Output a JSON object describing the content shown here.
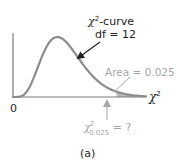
{
  "figure": {
    "caption": "(a)",
    "curve_label": {
      "symbol": "χ",
      "superscript": "2",
      "text": "-curve"
    },
    "df_label": "df = 12",
    "area_label": "Area = 0.025",
    "critical_value_label": {
      "symbol": "χ",
      "superscript": "2",
      "subscript": "0.025",
      "suffix": " = ?"
    },
    "x_axis_label": {
      "symbol": "χ",
      "superscript": "2"
    },
    "origin_label": "0",
    "colors": {
      "curve": "#8c8c8c",
      "axis": "#7a7a7a",
      "annotation_gray": "#a6a6a6",
      "text": "#222222",
      "arrow": "#222222",
      "shade": "#bdbdbd"
    }
  },
  "chart_data": {
    "type": "line",
    "distribution": "chi-square",
    "df": 12,
    "upper_tail_area": 0.025,
    "critical_value": "χ²₀.₀₂₅ = ?",
    "xlabel": "χ²",
    "ylabel": "",
    "x_start_tick": "0"
  }
}
